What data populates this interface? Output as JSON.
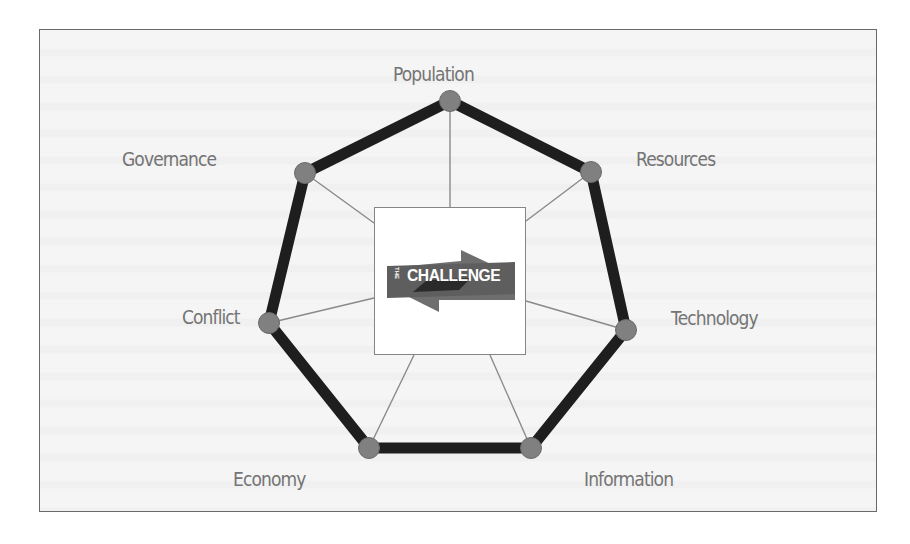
{
  "diagram": {
    "type": "heptagon-network",
    "center_logo": {
      "prefix": "THE",
      "title": "CHALLENGE",
      "icon": "bidirectional-arrows-icon"
    },
    "nodes": [
      {
        "id": "population",
        "label": "Population"
      },
      {
        "id": "resources",
        "label": "Resources"
      },
      {
        "id": "technology",
        "label": "Technology"
      },
      {
        "id": "information",
        "label": "Information"
      },
      {
        "id": "economy",
        "label": "Economy"
      },
      {
        "id": "conflict",
        "label": "Conflict"
      },
      {
        "id": "governance",
        "label": "Governance"
      }
    ],
    "colors": {
      "frame_border": "#6a6a6a",
      "background": "#f5f5f5",
      "ring": "#1e1e1e",
      "node_fill": "#808080",
      "spoke": "#8a8a8a",
      "label_text": "#747474",
      "logo_arrow": "#6e6e6e",
      "logo_band": "#2a2a2a"
    }
  }
}
